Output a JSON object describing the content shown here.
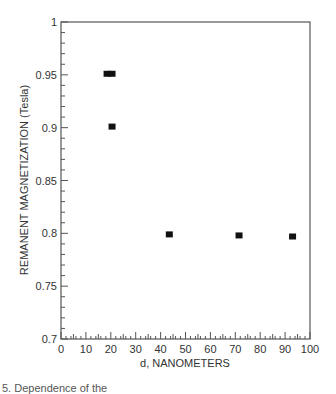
{
  "chart_data": {
    "type": "scatter",
    "title": "",
    "xlabel": "d, NANOMETERS",
    "ylabel": "REMANENT MAGNETIZATION (Tesla)",
    "xlim": [
      0,
      100
    ],
    "ylim": [
      0.7,
      1.0
    ],
    "x_ticks": [
      0,
      10,
      20,
      30,
      40,
      50,
      60,
      70,
      80,
      90,
      100
    ],
    "y_ticks": [
      0.7,
      0.75,
      0.8,
      0.85,
      0.9,
      0.95,
      1.0
    ],
    "y_tick_labels": [
      "0.7",
      "0.75",
      "0.8",
      "0.85",
      "0.9",
      "0.95",
      "1"
    ],
    "grid": false,
    "legend": null,
    "marker": "filled-square",
    "series": [
      {
        "name": "data",
        "points": [
          {
            "x": 18.5,
            "y": 0.951
          },
          {
            "x": 20.5,
            "y": 0.951
          },
          {
            "x": 20.5,
            "y": 0.901
          },
          {
            "x": 43.5,
            "y": 0.799
          },
          {
            "x": 71.5,
            "y": 0.798
          },
          {
            "x": 93.0,
            "y": 0.797
          }
        ]
      }
    ]
  },
  "caption": "5. Dependence of the"
}
